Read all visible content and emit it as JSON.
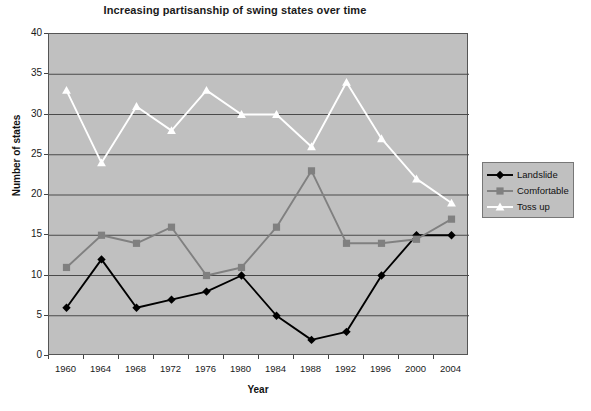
{
  "chart_data": {
    "type": "line",
    "title": "Increasing partisanship of swing states over time",
    "xlabel": "Year",
    "ylabel": "Number of states",
    "categories": [
      "1960",
      "1964",
      "1968",
      "1972",
      "1976",
      "1980",
      "1984",
      "1988",
      "1992",
      "1996",
      "2000",
      "2004"
    ],
    "x": [
      1960,
      1964,
      1968,
      1972,
      1976,
      1980,
      1984,
      1988,
      1992,
      1996,
      2000,
      2004
    ],
    "ylim": [
      0,
      40
    ],
    "ytick_values": [
      0,
      5,
      10,
      15,
      20,
      25,
      30,
      35,
      40
    ],
    "ytick_labels": [
      "0",
      "5",
      "10",
      "15",
      "20",
      "25",
      "30",
      "35",
      "40"
    ],
    "grid": "horizontal",
    "legend_position": "right",
    "plot_background": "#c0c0c0",
    "series": [
      {
        "name": "Landslide",
        "color": "#000000",
        "marker": "diamond",
        "marker_fill": "#000000",
        "values": [
          6,
          12,
          6,
          7,
          8,
          10,
          5,
          2,
          3,
          10,
          15,
          15
        ]
      },
      {
        "name": "Comfortable",
        "color": "#808080",
        "marker": "square",
        "marker_fill": "#808080",
        "values": [
          11,
          15,
          14,
          16,
          10,
          11,
          16,
          23,
          14,
          14,
          14.5,
          17
        ]
      },
      {
        "name": "Toss up",
        "color": "#ffffff",
        "marker": "triangle",
        "marker_fill": "#ffffff",
        "values": [
          33,
          24,
          31,
          28,
          33,
          30,
          30,
          26,
          34,
          27,
          22,
          19
        ]
      }
    ]
  }
}
